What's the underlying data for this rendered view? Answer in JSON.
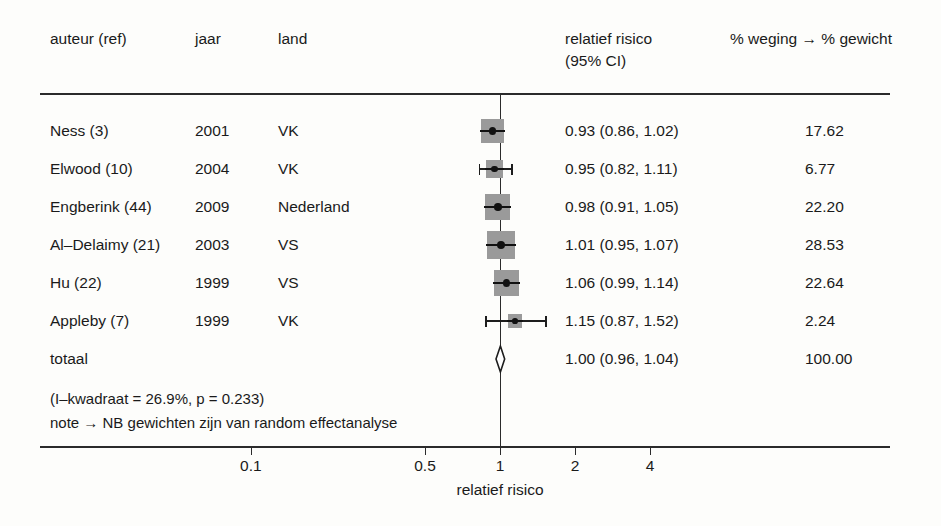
{
  "chart_data": {
    "type": "forest",
    "title": "",
    "xlabel": "relatief risico",
    "xscale": "log",
    "xticks": [
      0.1,
      0.5,
      1,
      2,
      4
    ],
    "xtick_labels": [
      "0.1",
      "0.5",
      "1",
      "2",
      "4"
    ],
    "null_value": 1,
    "columns": [
      "auteur (ref)",
      "jaar",
      "land",
      "relatief risico (95% CI)",
      "% weging → % gewicht"
    ],
    "studies": [
      {
        "author": "Ness (3)",
        "year": "2001",
        "country": "VK",
        "rr": 0.93,
        "lower": 0.86,
        "upper": 1.02,
        "effect_text": "0.93 (0.86, 1.02)",
        "weight": 17.62,
        "weight_text": "17.62"
      },
      {
        "author": "Elwood (10)",
        "year": "2004",
        "country": "VK",
        "rr": 0.95,
        "lower": 0.82,
        "upper": 1.11,
        "effect_text": "0.95 (0.82, 1.11)",
        "weight": 6.77,
        "weight_text": "6.77"
      },
      {
        "author": "Engberink (44)",
        "year": "2009",
        "country": "Nederland",
        "rr": 0.98,
        "lower": 0.91,
        "upper": 1.05,
        "effect_text": "0.98 (0.91, 1.05)",
        "weight": 22.2,
        "weight_text": "22.20"
      },
      {
        "author": "Al–Delaimy (21)",
        "year": "2003",
        "country": "VS",
        "rr": 1.01,
        "lower": 0.95,
        "upper": 1.07,
        "effect_text": "1.01 (0.95, 1.07)",
        "weight": 28.53,
        "weight_text": "28.53"
      },
      {
        "author": "Hu (22)",
        "year": "1999",
        "country": "VS",
        "rr": 1.06,
        "lower": 0.99,
        "upper": 1.14,
        "effect_text": "1.06 (0.99, 1.14)",
        "weight": 22.64,
        "weight_text": "22.64"
      },
      {
        "author": "Appleby (7)",
        "year": "1999",
        "country": "VK",
        "rr": 1.15,
        "lower": 0.87,
        "upper": 1.52,
        "effect_text": "1.15 (0.87, 1.52)",
        "weight": 2.24,
        "weight_text": "2.24"
      }
    ],
    "summary": {
      "label": "totaal",
      "rr": 1.0,
      "lower": 0.96,
      "upper": 1.04,
      "effect_text": "1.00 (0.96, 1.04)",
      "weight_text": "100.00"
    },
    "heterogeneity": "(I–kwadraat = 26.9%, p = 0.233)",
    "note": "note → NB gewichten zijn van random effectanalyse",
    "marker_color": "#9a9a9a",
    "line_color": "#2b2b2b"
  },
  "header": {
    "author": "auteur (ref)",
    "year": "jaar",
    "country": "land",
    "effect_line1": "relatief risico",
    "effect_line2": "(95% CI)",
    "weight": "% weging → % gewicht"
  },
  "axis": {
    "title": "relatief risico",
    "labels": [
      "0.1",
      "0.5",
      "1",
      "2",
      "4"
    ]
  }
}
